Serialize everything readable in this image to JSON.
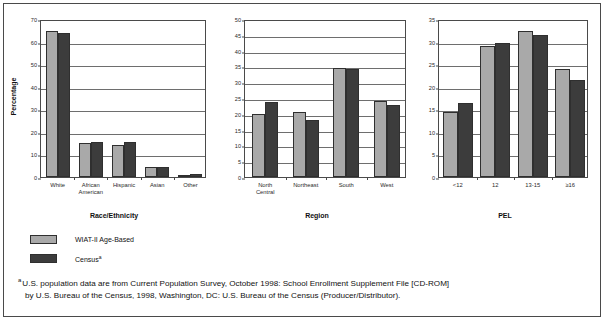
{
  "legend": {
    "items": [
      {
        "label": "WIAT-II Age-Based",
        "color": "#a9a9a9",
        "marker": ""
      },
      {
        "label": "Census",
        "color": "#3c3c3c",
        "marker": "a"
      }
    ]
  },
  "footnote": {
    "marker": "a",
    "line1": "U.S. population data are from Current Population Survey, October 1998: School Enrollment Supplement File [CD-ROM]",
    "line2": "by U.S. Bureau of the Census, 1998, Washington, DC: U.S. Bureau of the Census (Producer/Distributor)."
  },
  "chart_data": [
    {
      "type": "bar",
      "title": "",
      "xlabel": "Race/Ethnicity",
      "ylabel": "Percentage",
      "categories": [
        "White",
        "African\nAmerican",
        "Hispanic",
        "Asian",
        "Other"
      ],
      "ylim": [
        0,
        70
      ],
      "yticks": [
        0,
        10,
        20,
        30,
        40,
        50,
        60,
        70
      ],
      "grid": true,
      "legend_position": "below-left",
      "series": [
        {
          "name": "WIAT-II Age-Based",
          "color": "#a9a9a9",
          "values": [
            64.5,
            15.2,
            14.1,
            4.6,
            1.0
          ]
        },
        {
          "name": "Census",
          "color": "#3c3c3c",
          "values": [
            63.6,
            15.3,
            15.3,
            4.4,
            1.3
          ]
        }
      ]
    },
    {
      "type": "bar",
      "title": "",
      "xlabel": "Region",
      "ylabel": "",
      "categories": [
        "North\nCentral",
        "Northeast",
        "South",
        "West"
      ],
      "ylim": [
        0,
        50
      ],
      "yticks": [
        0,
        5,
        10,
        15,
        20,
        25,
        30,
        35,
        40,
        45,
        50
      ],
      "grid": true,
      "series": [
        {
          "name": "WIAT-II Age-Based",
          "color": "#a9a9a9",
          "values": [
            20.0,
            20.6,
            34.6,
            24.1
          ]
        },
        {
          "name": "Census",
          "color": "#3c3c3c",
          "values": [
            23.8,
            18.0,
            34.2,
            22.8
          ]
        }
      ]
    },
    {
      "type": "bar",
      "title": "",
      "xlabel": "PEL",
      "ylabel": "",
      "categories": [
        "<12",
        "12",
        "13-15",
        "≥16"
      ],
      "ylim": [
        0,
        35
      ],
      "yticks": [
        0,
        5,
        10,
        15,
        20,
        25,
        30,
        35
      ],
      "grid": true,
      "series": [
        {
          "name": "WIAT-II Age-Based",
          "color": "#a9a9a9",
          "values": [
            14.3,
            29.0,
            32.3,
            24.0
          ]
        },
        {
          "name": "Census",
          "color": "#3c3c3c",
          "values": [
            16.5,
            29.6,
            31.4,
            21.6
          ]
        }
      ]
    }
  ]
}
